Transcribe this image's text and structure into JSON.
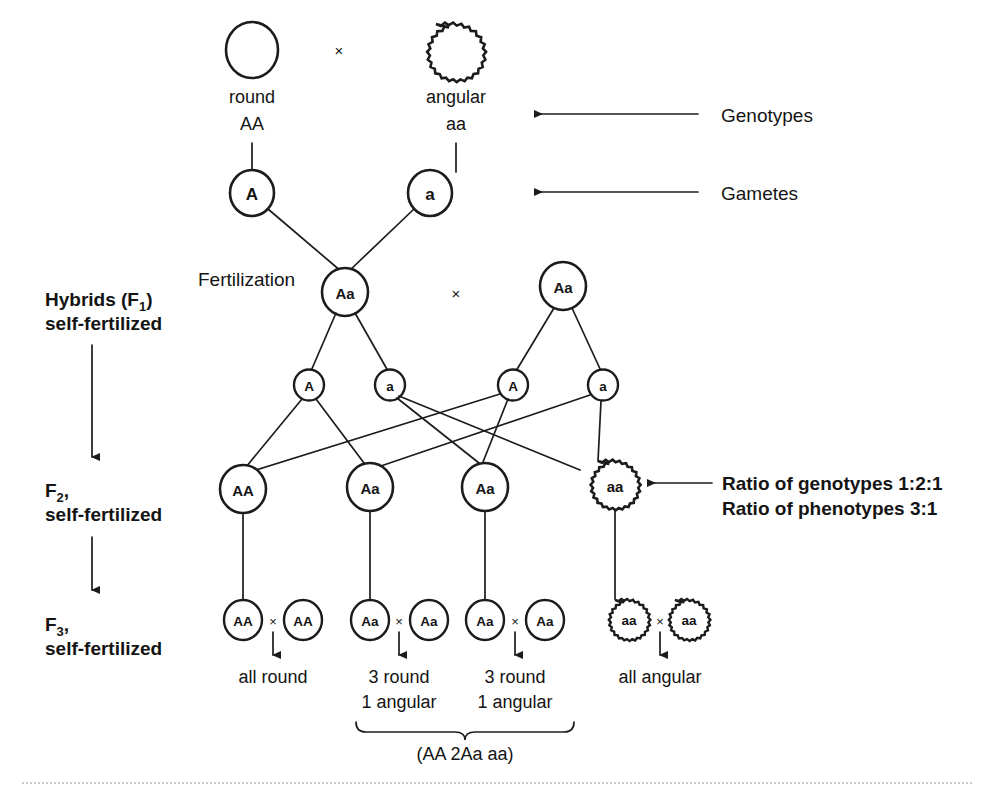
{
  "figure": {
    "ink_color": "#1c1c1c",
    "background": "#ffffff"
  },
  "parents": {
    "left": {
      "shape": "round-circle",
      "phenotype": "round",
      "genotype": "AA"
    },
    "cross_symbol": "×",
    "right": {
      "shape": "angular-scalloped",
      "phenotype": "angular",
      "genotype": "aa"
    }
  },
  "parent_gametes": [
    {
      "label": "A",
      "shape": "round-circle"
    },
    {
      "label": "a",
      "shape": "round-circle"
    }
  ],
  "fertilization_label": "Fertilization",
  "f1": {
    "left_genotype": "Aa",
    "cross_symbol": "×",
    "right_genotype": "Aa",
    "gametes": [
      "A",
      "a",
      "A",
      "a"
    ]
  },
  "f2": {
    "genotypes": [
      {
        "label": "AA",
        "shape": "round-circle"
      },
      {
        "label": "Aa",
        "shape": "round-circle"
      },
      {
        "label": "Aa",
        "shape": "round-circle"
      },
      {
        "label": "aa",
        "shape": "angular-scalloped"
      }
    ],
    "genotype_ratio_note": "Ratio of genotypes 1:2:1",
    "phenotype_ratio_note": "Ratio of phenotypes 3:1"
  },
  "f3": {
    "crosses": [
      {
        "left": {
          "label": "AA",
          "shape": "round-circle"
        },
        "symbol": "×",
        "right": {
          "label": "AA",
          "shape": "round-circle"
        },
        "outcome_line1": "all round",
        "outcome_line2": ""
      },
      {
        "left": {
          "label": "Aa",
          "shape": "round-circle"
        },
        "symbol": "×",
        "right": {
          "label": "Aa",
          "shape": "round-circle"
        },
        "outcome_line1": "3 round",
        "outcome_line2": "1 angular"
      },
      {
        "left": {
          "label": "Aa",
          "shape": "round-circle"
        },
        "symbol": "×",
        "right": {
          "label": "Aa",
          "shape": "round-circle"
        },
        "outcome_line1": "3 round",
        "outcome_line2": "1 angular"
      },
      {
        "left": {
          "label": "aa",
          "shape": "angular-scalloped"
        },
        "symbol": "×",
        "right": {
          "label": "aa",
          "shape": "angular-scalloped"
        },
        "outcome_line1": "all angular",
        "outcome_line2": ""
      }
    ],
    "brace_summary": "(AA 2Aa aa)"
  },
  "right_annotations": [
    {
      "label": "Genotypes",
      "arrow": "left-arrow"
    },
    {
      "label": "Gametes",
      "arrow": "left-arrow"
    }
  ],
  "left_annotations": {
    "hybrids_line1_main": "Hybrids (F",
    "hybrids_line1_sub": "1",
    "hybrids_line1_close": ")",
    "hybrids_line2": "self-fertilized",
    "f2_main": "F",
    "f2_sub": "2",
    "f2_comma": ",",
    "f2_line2": "self-fertilized",
    "f3_main": "F",
    "f3_sub": "3",
    "f3_comma": ",",
    "f3_line2": "self-fertilized"
  }
}
